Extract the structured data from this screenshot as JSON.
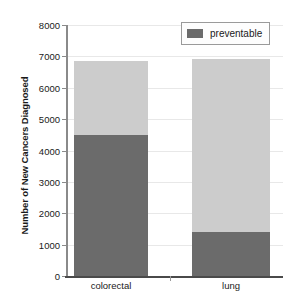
{
  "chart_data": {
    "type": "bar",
    "subtype": "stacked",
    "title": "",
    "xlabel": "",
    "ylabel": "Number of New Cancers Diagnosed",
    "categories": [
      "colorectal",
      "lung"
    ],
    "series": [
      {
        "name": "preventable",
        "values": [
          4500,
          1400
        ],
        "color": "#6b6b6b"
      },
      {
        "name": "not preventable",
        "values": [
          2360,
          5530
        ],
        "color": "#cccccc"
      }
    ],
    "totals": [
      6860,
      6930
    ],
    "ylim": [
      0,
      8000
    ],
    "y_ticks": [
      0,
      1000,
      2000,
      3000,
      4000,
      5000,
      6000,
      7000,
      8000
    ],
    "y_tick_labels": [
      "0",
      "1000",
      "2000",
      "3000",
      "4000",
      "5000",
      "6000",
      "7000",
      "8000"
    ],
    "grid": true,
    "legend_position": "top-right",
    "legend_entries": [
      "preventable"
    ]
  },
  "axes": {
    "y_title": "Number of New Cancers Diagnosed",
    "y_tick_labels": [
      "8000",
      "7000",
      "6000",
      "5000",
      "4000",
      "3000",
      "2000",
      "1000",
      "0"
    ],
    "x_tick_labels": [
      "colorectal",
      "lung"
    ]
  },
  "legend": {
    "label": "preventable",
    "swatch_color": "#6b6b6b"
  },
  "colors": {
    "preventable": "#6b6b6b",
    "not_preventable": "#cccccc",
    "gridline": "#e8e8e8",
    "axis": "#8a8a8a",
    "text": "#1a1a1a",
    "background": "#ffffff"
  }
}
